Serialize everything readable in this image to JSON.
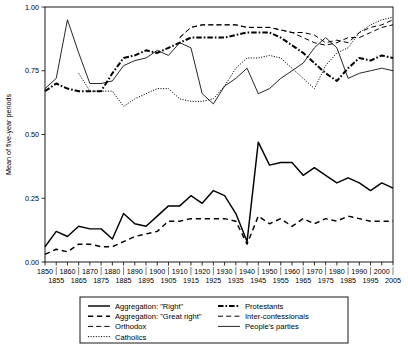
{
  "chart_data": {
    "type": "line",
    "title": "",
    "xlabel": "",
    "ylabel": "Mean of five-year periods",
    "xlim": [
      1850,
      2005
    ],
    "ylim": [
      0.0,
      1.0
    ],
    "grid": false,
    "legend_position": "bottom",
    "y_ticks": [
      "0.00",
      "0.25",
      "0.50",
      "0.75",
      "1.00"
    ],
    "y_tick_values": [
      0.0,
      0.25,
      0.5,
      0.75,
      1.0
    ],
    "x_ticks_upper": [
      1850,
      1860,
      1870,
      1880,
      1890,
      1900,
      1910,
      1920,
      1930,
      1940,
      1950,
      1960,
      1970,
      1980,
      1990,
      2000
    ],
    "x_ticks_lower": [
      1855,
      1865,
      1875,
      1885,
      1895,
      1905,
      1915,
      1925,
      1935,
      1945,
      1955,
      1965,
      1975,
      1985,
      1995,
      2005
    ],
    "x": [
      1850,
      1855,
      1860,
      1865,
      1870,
      1875,
      1880,
      1885,
      1890,
      1895,
      1900,
      1905,
      1910,
      1915,
      1920,
      1925,
      1930,
      1935,
      1940,
      1945,
      1950,
      1955,
      1960,
      1965,
      1970,
      1975,
      1980,
      1985,
      1990,
      1995,
      2000,
      2005
    ],
    "series": [
      {
        "name": "Aggregation: \"Right\"",
        "style": "solid",
        "width": 1.45,
        "values": [
          0.06,
          0.12,
          0.1,
          0.14,
          0.13,
          0.13,
          0.09,
          0.19,
          0.15,
          0.14,
          0.18,
          0.22,
          0.22,
          0.26,
          0.23,
          0.28,
          0.26,
          0.19,
          0.08,
          0.47,
          0.38,
          0.39,
          0.39,
          0.34,
          0.37,
          0.34,
          0.31,
          0.33,
          0.31,
          0.28,
          0.31,
          0.29
        ]
      },
      {
        "name": "Aggregation: \"Great right\"",
        "style": "dashed",
        "width": 1.45,
        "values": [
          0.03,
          0.05,
          0.04,
          0.07,
          0.07,
          0.06,
          0.06,
          0.08,
          0.1,
          0.11,
          0.12,
          0.16,
          0.16,
          0.17,
          0.17,
          0.17,
          0.17,
          0.16,
          0.07,
          0.18,
          0.15,
          0.17,
          0.14,
          0.17,
          0.15,
          0.17,
          0.16,
          0.18,
          0.17,
          0.16,
          0.16,
          0.16
        ]
      },
      {
        "name": "Orthodox",
        "style": "dash-wide",
        "width": 1.0,
        "values": [
          null,
          null,
          null,
          null,
          null,
          null,
          null,
          null,
          null,
          null,
          null,
          null,
          0.88,
          0.92,
          0.93,
          0.93,
          0.93,
          0.93,
          0.92,
          0.92,
          0.92,
          0.91,
          0.9,
          0.9,
          0.89,
          0.86,
          0.87,
          0.86,
          0.9,
          0.92,
          0.93,
          0.95
        ]
      },
      {
        "name": "Catholics",
        "style": "dotted",
        "width": 1.0,
        "values": [
          null,
          null,
          null,
          0.74,
          0.67,
          0.67,
          0.67,
          0.61,
          0.64,
          0.66,
          0.68,
          0.68,
          0.64,
          0.63,
          0.63,
          0.64,
          0.69,
          0.76,
          0.8,
          0.8,
          0.81,
          0.8,
          0.76,
          0.72,
          0.68,
          0.77,
          0.82,
          0.84,
          0.9,
          0.93,
          0.95,
          0.96
        ]
      },
      {
        "name": "Protestants",
        "style": "dashdot",
        "width": 2.0,
        "values": [
          0.67,
          0.7,
          0.68,
          0.67,
          0.67,
          0.67,
          0.74,
          0.8,
          0.81,
          0.83,
          0.82,
          0.84,
          0.86,
          0.88,
          0.88,
          0.88,
          0.88,
          0.89,
          0.9,
          0.9,
          0.9,
          0.88,
          0.85,
          0.82,
          0.78,
          0.74,
          0.71,
          0.76,
          0.8,
          0.79,
          0.81,
          0.8
        ]
      },
      {
        "name": "Inter-confessionals",
        "style": "dash-wide",
        "width": 1.0,
        "values": [
          null,
          null,
          null,
          null,
          null,
          null,
          null,
          null,
          null,
          null,
          null,
          null,
          0.88,
          0.92,
          0.93,
          0.93,
          0.93,
          0.93,
          0.92,
          0.92,
          0.92,
          0.91,
          0.9,
          0.88,
          0.86,
          0.85,
          0.86,
          0.88,
          0.88,
          0.9,
          0.92,
          0.93
        ]
      },
      {
        "name": "People's parties",
        "style": "solid",
        "width": 0.85,
        "values": [
          0.68,
          0.72,
          0.95,
          0.82,
          0.7,
          0.7,
          0.71,
          0.77,
          0.79,
          0.8,
          0.83,
          0.81,
          0.86,
          0.84,
          0.66,
          0.62,
          0.69,
          0.72,
          0.76,
          0.66,
          0.68,
          0.72,
          0.75,
          0.78,
          0.84,
          0.88,
          0.84,
          0.72,
          0.74,
          0.75,
          0.76,
          0.75
        ]
      }
    ]
  },
  "legend": {
    "entries": [
      {
        "label": "Aggregation: \"Right\"",
        "style": "solid",
        "width": 1.45,
        "column": 0
      },
      {
        "label": "Aggregation: \"Great right\"",
        "style": "dashed",
        "width": 1.45,
        "column": 0
      },
      {
        "label": "Orthodox",
        "style": "dash-wide",
        "width": 1.0,
        "column": 0
      },
      {
        "label": "Catholics",
        "style": "dotted",
        "width": 1.0,
        "column": 0
      },
      {
        "label": "Protestants",
        "style": "dashdot",
        "width": 2.0,
        "column": 1
      },
      {
        "label": "Inter-confessionals",
        "style": "dash-wide",
        "width": 1.0,
        "column": 1
      },
      {
        "label": "People's parties",
        "style": "solid",
        "width": 0.85,
        "column": 1
      }
    ]
  },
  "colors": {
    "line": "#000000",
    "background": "#ffffff",
    "axis": "#000000"
  }
}
